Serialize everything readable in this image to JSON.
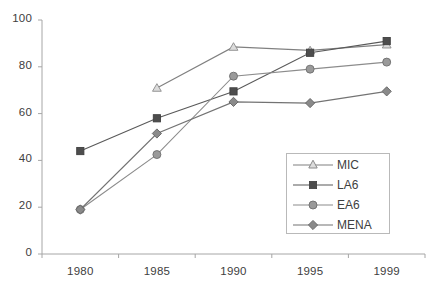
{
  "chart_data": {
    "type": "line",
    "title": "",
    "xlabel": "",
    "ylabel": "",
    "categories": [
      "1980",
      "1985",
      "1990",
      "1995",
      "1999"
    ],
    "ylim": [
      0,
      100
    ],
    "yticks": [
      0,
      20,
      40,
      60,
      80,
      100
    ],
    "grid": false,
    "legend_position": "inside-bottom-right",
    "series": [
      {
        "name": "MIC",
        "marker": "triangle-open",
        "color": "#808080",
        "values": [
          null,
          71,
          88.5,
          87,
          89.5
        ]
      },
      {
        "name": "LA6",
        "marker": "square-filled",
        "color": "#595959",
        "values": [
          44,
          58,
          69.5,
          86,
          91
        ]
      },
      {
        "name": "EA6",
        "marker": "circle-filled",
        "color": "#8c8c8c",
        "values": [
          19,
          42.5,
          76,
          79,
          82
        ]
      },
      {
        "name": "MENA",
        "marker": "diamond-filled",
        "color": "#737373",
        "values": [
          19,
          51.5,
          65,
          64.5,
          69.5
        ]
      }
    ]
  },
  "axis": {
    "y_labels": [
      "100",
      "80",
      "60",
      "40",
      "20",
      "0"
    ],
    "x_labels": [
      "1980",
      "1985",
      "1990",
      "1995",
      "1999"
    ]
  },
  "legend": {
    "items": [
      {
        "label": "MIC"
      },
      {
        "label": "LA6"
      },
      {
        "label": "EA6"
      },
      {
        "label": "MENA"
      }
    ]
  },
  "colors": {
    "axis": "#a6a6a6",
    "text": "#404040",
    "legend_border": "#b9b9b9",
    "mic": "#808080",
    "la6": "#595959",
    "ea6": "#8c8c8c",
    "mena": "#737373"
  }
}
